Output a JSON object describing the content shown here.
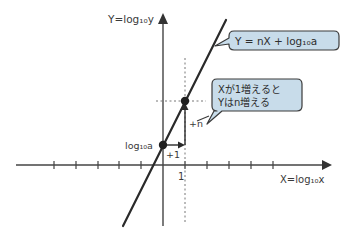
{
  "diagram": {
    "type": "log-linear graph",
    "y_axis_label": "Y=log₁₀y",
    "x_axis_label": "X=log₁₀x",
    "intercept_label": "log₁₀a",
    "x_tick_label": "1",
    "step_x_label": "+1",
    "step_y_label": "+n",
    "equation_bubble": "Y = nX + log₁₀a",
    "explanation_bubble": {
      "line1": "Xが1増えると",
      "line2": "Yはn増える"
    },
    "colors": {
      "bubble_fill": "#c8dcea",
      "bubble_stroke": "#3a3a3a",
      "line": "#2a2a2a",
      "axis": "#444444",
      "dashed": "#777777"
    }
  }
}
